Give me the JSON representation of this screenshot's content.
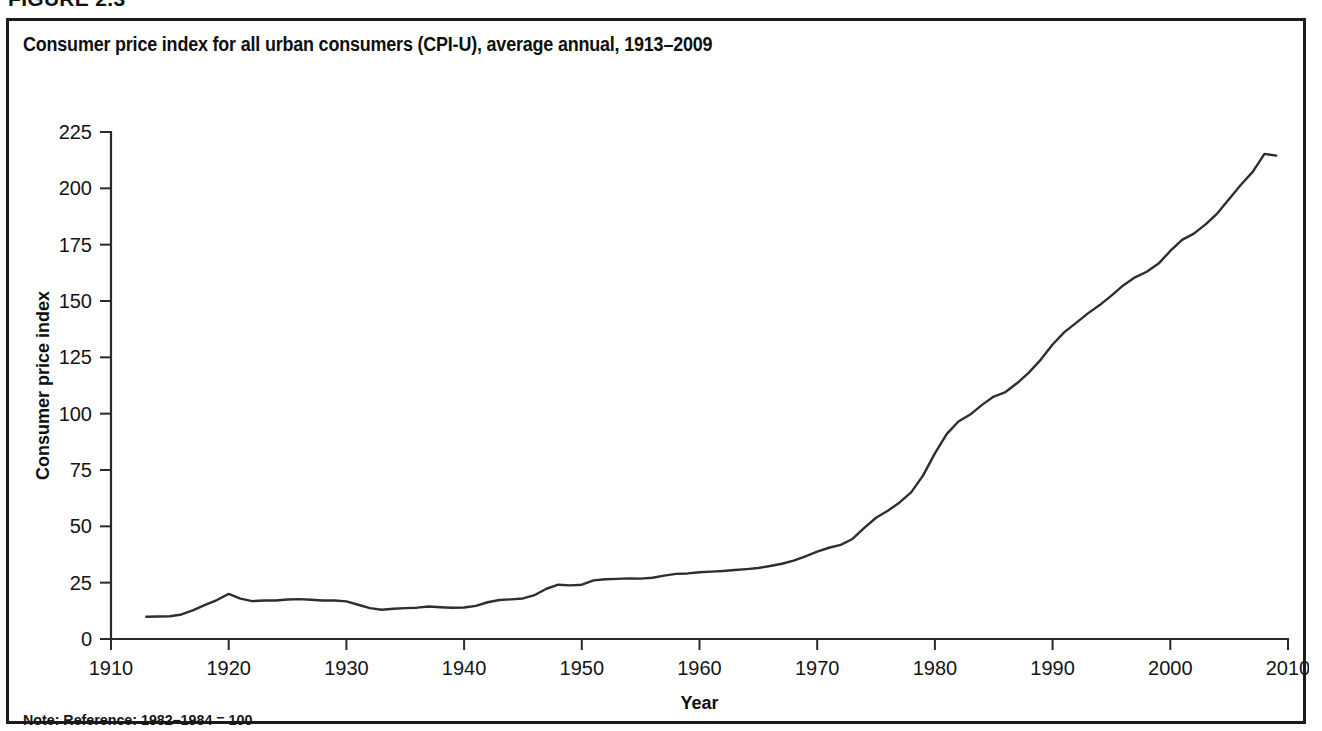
{
  "figure": {
    "caption": "FIGURE 2.3",
    "note": "Note: Reference: 1982–1984 = 100"
  },
  "chart_data": {
    "type": "line",
    "title": "Consumer price index for all urban consumers (CPI-U), average annual, 1913–2009",
    "xlabel": "Year",
    "ylabel": "Consumer price index",
    "xlim": [
      1910,
      2010
    ],
    "ylim": [
      0,
      225
    ],
    "xticks": [
      1910,
      1920,
      1930,
      1940,
      1950,
      1960,
      1970,
      1980,
      1990,
      2000,
      2010
    ],
    "yticks": [
      0,
      25,
      50,
      75,
      100,
      125,
      150,
      175,
      200,
      225
    ],
    "grid": false,
    "legend": null,
    "line_color": "#2e2e2e",
    "series": [
      {
        "name": "CPI-U",
        "x": [
          1913,
          1914,
          1915,
          1916,
          1917,
          1918,
          1919,
          1920,
          1921,
          1922,
          1923,
          1924,
          1925,
          1926,
          1927,
          1928,
          1929,
          1930,
          1931,
          1932,
          1933,
          1934,
          1935,
          1936,
          1937,
          1938,
          1939,
          1940,
          1941,
          1942,
          1943,
          1944,
          1945,
          1946,
          1947,
          1948,
          1949,
          1950,
          1951,
          1952,
          1953,
          1954,
          1955,
          1956,
          1957,
          1958,
          1959,
          1960,
          1961,
          1962,
          1963,
          1964,
          1965,
          1966,
          1967,
          1968,
          1969,
          1970,
          1971,
          1972,
          1973,
          1974,
          1975,
          1976,
          1977,
          1978,
          1979,
          1980,
          1981,
          1982,
          1983,
          1984,
          1985,
          1986,
          1987,
          1988,
          1989,
          1990,
          1991,
          1992,
          1993,
          1994,
          1995,
          1996,
          1997,
          1998,
          1999,
          2000,
          2001,
          2002,
          2003,
          2004,
          2005,
          2006,
          2007,
          2008,
          2009
        ],
        "values": [
          9.9,
          10.0,
          10.1,
          10.9,
          12.8,
          15.1,
          17.3,
          20.0,
          17.9,
          16.8,
          17.1,
          17.1,
          17.5,
          17.7,
          17.4,
          17.1,
          17.1,
          16.7,
          15.2,
          13.7,
          13.0,
          13.4,
          13.7,
          13.9,
          14.4,
          14.1,
          13.9,
          14.0,
          14.7,
          16.3,
          17.3,
          17.6,
          18.0,
          19.5,
          22.3,
          24.1,
          23.8,
          24.1,
          26.0,
          26.5,
          26.7,
          26.9,
          26.8,
          27.2,
          28.1,
          28.9,
          29.1,
          29.6,
          29.9,
          30.2,
          30.6,
          31.0,
          31.5,
          32.4,
          33.4,
          34.8,
          36.7,
          38.8,
          40.5,
          41.8,
          44.4,
          49.3,
          53.8,
          56.9,
          60.6,
          65.2,
          72.6,
          82.4,
          90.9,
          96.5,
          99.6,
          103.9,
          107.6,
          109.6,
          113.6,
          118.3,
          124.0,
          130.7,
          136.2,
          140.3,
          144.5,
          148.2,
          152.4,
          156.9,
          160.5,
          163.0,
          166.6,
          172.2,
          177.1,
          179.9,
          184.0,
          188.9,
          195.3,
          201.6,
          207.3,
          215.3,
          214.5
        ]
      }
    ]
  }
}
